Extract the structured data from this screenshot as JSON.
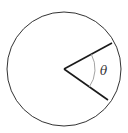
{
  "diagram": {
    "type": "circle-sector-angle",
    "angle_label": "θ",
    "colors": {
      "circle": "#333333",
      "radius": "#1a1a1a",
      "arc": "#999999",
      "background": "#ffffff"
    },
    "circle": {
      "cx": 64,
      "cy": 69,
      "r": 57
    },
    "radii": [
      {
        "x2": 112,
        "y2": 43
      },
      {
        "x2": 108,
        "y2": 100
      }
    ],
    "angle_arc_radius": 31
  }
}
